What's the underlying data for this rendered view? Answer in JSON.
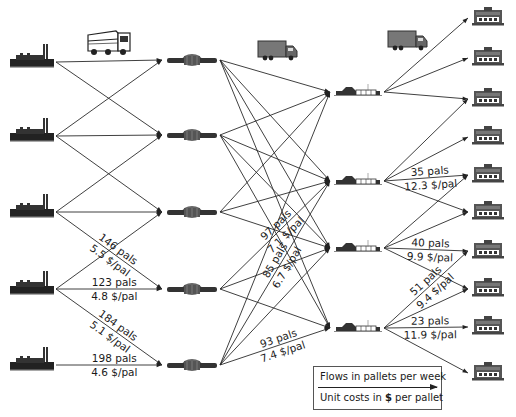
{
  "diagram": {
    "type": "supply-chain-network",
    "colors": {
      "line": "#2a2a2a",
      "icon": "#333333",
      "icon_light": "#8a8a8a",
      "text": "#1a1a1a"
    },
    "tiers": {
      "plants": {
        "icon": "factory-icon",
        "nodes": [
          {
            "id": "P1",
            "x": 32,
            "y": 62
          },
          {
            "id": "P2",
            "x": 32,
            "y": 136
          },
          {
            "id": "P3",
            "x": 32,
            "y": 212
          },
          {
            "id": "P4",
            "x": 32,
            "y": 289
          },
          {
            "id": "P5",
            "x": 32,
            "y": 365
          }
        ]
      },
      "warehouses": {
        "icon": "warehouse-icon",
        "nodes": [
          {
            "id": "W1",
            "x": 192,
            "y": 60
          },
          {
            "id": "W2",
            "x": 192,
            "y": 135
          },
          {
            "id": "W3",
            "x": 192,
            "y": 212
          },
          {
            "id": "W4",
            "x": 192,
            "y": 289
          },
          {
            "id": "W5",
            "x": 192,
            "y": 365
          }
        ]
      },
      "crossdocks": {
        "icon": "distribution-center-icon",
        "nodes": [
          {
            "id": "D1",
            "x": 358,
            "y": 92
          },
          {
            "id": "D2",
            "x": 358,
            "y": 181
          },
          {
            "id": "D3",
            "x": 358,
            "y": 248
          },
          {
            "id": "D4",
            "x": 358,
            "y": 328
          }
        ]
      },
      "stores": {
        "icon": "store-icon",
        "nodes": [
          {
            "id": "S1",
            "x": 488,
            "y": 18
          },
          {
            "id": "S2",
            "x": 488,
            "y": 58
          },
          {
            "id": "S3",
            "x": 488,
            "y": 99
          },
          {
            "id": "S4",
            "x": 488,
            "y": 137
          },
          {
            "id": "S5",
            "x": 488,
            "y": 175
          },
          {
            "id": "S6",
            "x": 488,
            "y": 212
          },
          {
            "id": "S7",
            "x": 488,
            "y": 251
          },
          {
            "id": "S8",
            "x": 488,
            "y": 289
          },
          {
            "id": "S9",
            "x": 488,
            "y": 327
          },
          {
            "id": "S10",
            "x": 488,
            "y": 373
          }
        ]
      }
    },
    "vehicles": [
      {
        "name": "heavy-truck-icon",
        "x": 110,
        "y": 45
      },
      {
        "name": "box-truck-icon",
        "x": 278,
        "y": 50
      },
      {
        "name": "box-truck-icon",
        "x": 408,
        "y": 40
      }
    ],
    "flows": [
      {
        "from": "P1",
        "to": "W1"
      },
      {
        "from": "P1",
        "to": "W2"
      },
      {
        "from": "P2",
        "to": "W1"
      },
      {
        "from": "P2",
        "to": "W2"
      },
      {
        "from": "P2",
        "to": "W3"
      },
      {
        "from": "P3",
        "to": "W2"
      },
      {
        "from": "P3",
        "to": "W3"
      },
      {
        "from": "P3",
        "to": "W4",
        "pals": "146 pals",
        "cost": "5.5 $/pal"
      },
      {
        "from": "P4",
        "to": "W3"
      },
      {
        "from": "P4",
        "to": "W4",
        "pals": "123 pals",
        "cost": "4.8 $/pal"
      },
      {
        "from": "P4",
        "to": "W5",
        "pals": "184 pals",
        "cost": "5.1 $/pal"
      },
      {
        "from": "P5",
        "to": "W5",
        "pals": "198 pals",
        "cost": "4.6 $/pal"
      },
      {
        "from": "W1",
        "to": "D1"
      },
      {
        "from": "W1",
        "to": "D2"
      },
      {
        "from": "W1",
        "to": "D3"
      },
      {
        "from": "W1",
        "to": "D4"
      },
      {
        "from": "W2",
        "to": "D1"
      },
      {
        "from": "W2",
        "to": "D2"
      },
      {
        "from": "W2",
        "to": "D3"
      },
      {
        "from": "W2",
        "to": "D4"
      },
      {
        "from": "W3",
        "to": "D1"
      },
      {
        "from": "W3",
        "to": "D2"
      },
      {
        "from": "W3",
        "to": "D3"
      },
      {
        "from": "W4",
        "to": "D2",
        "pals": "97 pals",
        "cost": "7.1 $/pal"
      },
      {
        "from": "W4",
        "to": "D3"
      },
      {
        "from": "W4",
        "to": "D4"
      },
      {
        "from": "W5",
        "to": "D1"
      },
      {
        "from": "W5",
        "to": "D2",
        "pals": "85 pals",
        "cost": "6.7 $/pal"
      },
      {
        "from": "W5",
        "to": "D3"
      },
      {
        "from": "W5",
        "to": "D4",
        "pals": "93 pals",
        "cost": "7.4 $/pal"
      },
      {
        "from": "D1",
        "to": "S1"
      },
      {
        "from": "D1",
        "to": "S2"
      },
      {
        "from": "D1",
        "to": "S3"
      },
      {
        "from": "D2",
        "to": "S3"
      },
      {
        "from": "D2",
        "to": "S4"
      },
      {
        "from": "D2",
        "to": "S5",
        "pals": "35 pals",
        "cost": "12.3 $/pal"
      },
      {
        "from": "D2",
        "to": "S6"
      },
      {
        "from": "D3",
        "to": "S5"
      },
      {
        "from": "D3",
        "to": "S6"
      },
      {
        "from": "D3",
        "to": "S7",
        "pals": "40 pals",
        "cost": "9.9 $/pal"
      },
      {
        "from": "D3",
        "to": "S8"
      },
      {
        "from": "D4",
        "to": "S7",
        "pals": "51 pals",
        "cost": "9.4 $/pal"
      },
      {
        "from": "D4",
        "to": "S8"
      },
      {
        "from": "D4",
        "to": "S9",
        "pals": "23 pals",
        "cost": "11.9 $/pal"
      },
      {
        "from": "D4",
        "to": "S10"
      }
    ]
  },
  "legend": {
    "flow_label": "Flows in pallets per week",
    "cost_label_prefix": "Unit costs in ",
    "cost_label_symbol": "$",
    "cost_label_suffix": " per pallet"
  }
}
